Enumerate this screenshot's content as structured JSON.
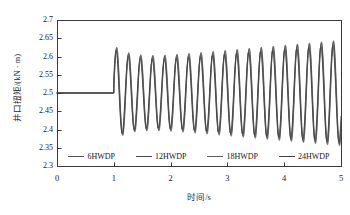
{
  "figure": {
    "background": "#ffffff",
    "frame_color": "#3a3a3a"
  },
  "axis": {
    "x_title": "时间/s",
    "y_title": "井口扭矩/(kN · m)",
    "x_ticks": [
      "0",
      "1",
      "2",
      "3",
      "4",
      "5"
    ],
    "y_ticks": [
      "2.3",
      "2.35",
      "2.4",
      "2.45",
      "2.5",
      "2.55",
      "2.6",
      "2.65",
      "2.7"
    ]
  },
  "legend": {
    "items": [
      {
        "label": "6HWDP",
        "color": "#555555"
      },
      {
        "label": "12HWDP",
        "color": "#4a4a4a"
      },
      {
        "label": "18HWDP",
        "color": "#606060"
      },
      {
        "label": "24HWDP",
        "color": "#3f3f3f"
      }
    ]
  },
  "chart_data": {
    "type": "line",
    "title": "",
    "xlabel": "时间/s",
    "ylabel": "井口扭矩/(kN · m)",
    "xlim": [
      0,
      5
    ],
    "ylim": [
      2.3,
      2.7
    ],
    "xticks": [
      0,
      1,
      2,
      3,
      4,
      5
    ],
    "yticks": [
      2.3,
      2.35,
      2.4,
      2.45,
      2.5,
      2.55,
      2.6,
      2.65,
      2.7
    ],
    "grid": false,
    "legend_position": "inside-bottom",
    "step_time": 1.0,
    "baseline": 2.5,
    "period": 0.212,
    "series": [
      {
        "name": "6HWDP",
        "color": "#555555",
        "phase_offset": 0.0,
        "amp_start": 0.131,
        "amp_settle": 0.09,
        "amp_end": 0.145,
        "offset": 0.0
      },
      {
        "name": "12HWDP",
        "color": "#4a4a4a",
        "phase_offset": 0.004,
        "amp_start": 0.128,
        "amp_settle": 0.087,
        "amp_end": 0.141,
        "offset": 0.0
      },
      {
        "name": "18HWDP",
        "color": "#606060",
        "phase_offset": 0.008,
        "amp_start": 0.125,
        "amp_settle": 0.084,
        "amp_end": 0.137,
        "offset": -0.001
      },
      {
        "name": "24HWDP",
        "color": "#3f3f3f",
        "phase_offset": 0.012,
        "amp_start": 0.122,
        "amp_settle": 0.081,
        "amp_end": 0.133,
        "offset": -0.002
      }
    ],
    "reference_points": [
      {
        "t": 0.0,
        "value": 2.5
      },
      {
        "t": 1.0,
        "value": 2.5
      },
      {
        "t": 1.06,
        "value": 2.631
      },
      {
        "t": 1.16,
        "value": 2.398
      },
      {
        "t": 1.28,
        "value": 2.601
      },
      {
        "t": 2.0,
        "value": 2.592
      },
      {
        "t": 3.0,
        "value": 2.606
      },
      {
        "t": 4.0,
        "value": 2.628
      },
      {
        "t": 4.9,
        "value": 2.645
      },
      {
        "t": 5.0,
        "value": 2.46
      }
    ]
  },
  "geometry": {
    "plot_left": 57,
    "plot_right": 341,
    "plot_top": 20,
    "plot_bottom": 166
  }
}
